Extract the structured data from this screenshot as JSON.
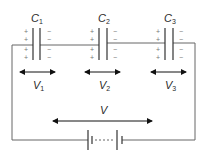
{
  "diagram": {
    "capacitors": [
      {
        "label": "C",
        "sub": "1",
        "plus": [
          "+",
          "+",
          "+",
          "+"
        ],
        "minus": [
          "−",
          "−",
          "−",
          "−"
        ],
        "voltage_label": "V",
        "voltage_sub": "1"
      },
      {
        "label": "C",
        "sub": "2",
        "plus": [
          "+",
          "+",
          "+",
          "+"
        ],
        "minus": [
          "−",
          "−",
          "−",
          "−"
        ],
        "voltage_label": "V",
        "voltage_sub": "2"
      },
      {
        "label": "C",
        "sub": "3",
        "plus": [
          "+",
          "+",
          "+",
          "+"
        ],
        "minus": [
          "−",
          "−",
          "−",
          "−"
        ],
        "voltage_label": "V",
        "voltage_sub": "3"
      }
    ],
    "total_voltage_label": "V",
    "source": "battery"
  },
  "colors": {
    "wire": "#666666",
    "plate": "#333333",
    "arrow": "#111111",
    "text": "#2a2a2a"
  }
}
